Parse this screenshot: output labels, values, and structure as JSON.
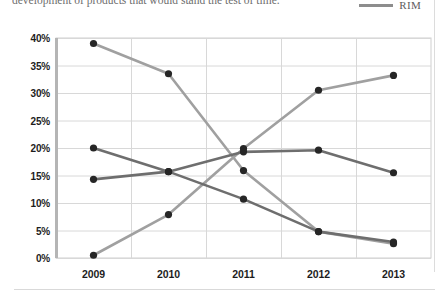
{
  "page": {
    "body_text": "development of products that would stand the test of time."
  },
  "legend": {
    "items": [
      {
        "label": "RIM",
        "color": "#8d8d8d",
        "icon": "line-swatch-icon"
      }
    ]
  },
  "chart_data": {
    "type": "line",
    "title": "",
    "subtitle": "",
    "xlabel": "",
    "ylabel": "",
    "categories": [
      "2009",
      "2010",
      "2011",
      "2012",
      "2013"
    ],
    "ylim": [
      0,
      40
    ],
    "yticks": [
      0,
      5,
      10,
      15,
      20,
      25,
      30,
      35,
      40
    ],
    "ytick_labels": [
      "0%",
      "5%",
      "10%",
      "15%",
      "20%",
      "25%",
      "30%",
      "35%",
      "40%"
    ],
    "grid": true,
    "legend_position": "top-right",
    "series": [
      {
        "name": "RIM",
        "color": "#a0a0a0",
        "values": [
          39.0,
          33.5,
          15.9,
          4.8,
          2.6
        ]
      },
      {
        "name": "Series 2",
        "color": "#a0a0a0",
        "values": [
          0.5,
          7.9,
          19.9,
          30.5,
          33.2
        ]
      },
      {
        "name": "Series 3",
        "color": "#6e6e6e",
        "values": [
          20.0,
          15.7,
          19.3,
          19.6,
          15.5
        ]
      },
      {
        "name": "Series 4",
        "color": "#6e6e6e",
        "values": [
          14.3,
          15.7,
          10.7,
          4.8,
          2.9
        ]
      }
    ]
  }
}
